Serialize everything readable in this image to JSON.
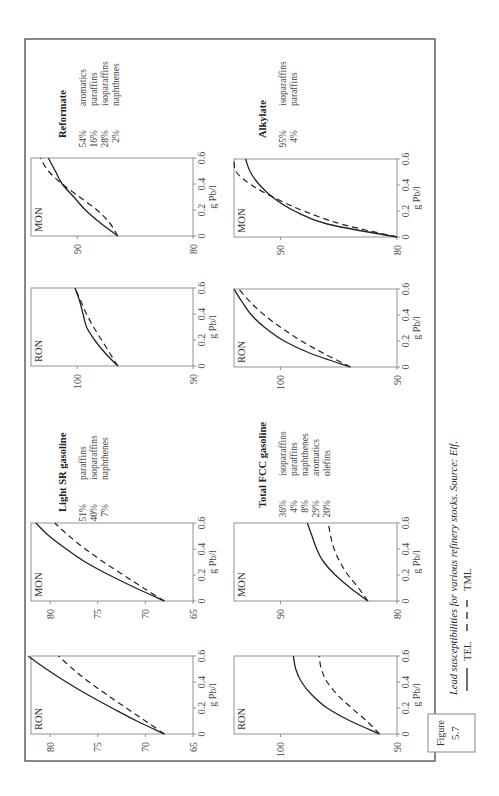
{
  "figure": {
    "label": "Figure",
    "number": "5.7",
    "caption": "Lead susceptibilities for various refinery stocks. Source: Elf.",
    "legend": [
      {
        "name": "TEL",
        "style": "solid"
      },
      {
        "name": "TML",
        "style": "dashed"
      }
    ],
    "x_axis_label": "g Pb/l",
    "x_ticks": [
      "0",
      "0.2",
      "0.4",
      "0.6"
    ]
  },
  "stocks": [
    {
      "name": "Reformate",
      "composition": [
        {
          "pct": "54%",
          "component": "aromatics"
        },
        {
          "pct": "16%",
          "component": "paraffins"
        },
        {
          "pct": "28%",
          "component": "isoparaffins"
        },
        {
          "pct": "2%",
          "component": "naphthenes"
        }
      ]
    },
    {
      "name": "Alkylate",
      "composition": [
        {
          "pct": "95%",
          "component": "isoparaffins"
        },
        {
          "pct": "4%",
          "component": "paraffins"
        }
      ]
    },
    {
      "name": "Light SR gasoline",
      "composition": [
        {
          "pct": "51%",
          "component": "paraffins"
        },
        {
          "pct": "40%",
          "component": "isoparaffins"
        },
        {
          "pct": "7%",
          "component": "naphthenes"
        }
      ]
    },
    {
      "name": "Total FCC gasoline",
      "composition": [
        {
          "pct": "36%",
          "component": "isoparaffins"
        },
        {
          "pct": "4%",
          "component": "paraffins"
        },
        {
          "pct": "8%",
          "component": "naphthenes"
        },
        {
          "pct": "29%",
          "component": "aromatics"
        },
        {
          "pct": "20%",
          "component": "olefins"
        }
      ]
    }
  ],
  "chart_data": [
    {
      "type": "line",
      "stock": "Reformate",
      "panel": "MON",
      "xlabel": "g Pb/l",
      "ylabel": "MON",
      "xlim": [
        0,
        0.6
      ],
      "ylim": [
        80,
        94
      ],
      "y_ticks": [
        "80",
        "90"
      ],
      "x": [
        0,
        0.1,
        0.2,
        0.3,
        0.4,
        0.5,
        0.6
      ],
      "series": [
        {
          "name": "TEL",
          "values": [
            86.5,
            88.0,
            89.3,
            90.3,
            91.3,
            91.9,
            92.5
          ]
        },
        {
          "name": "TML",
          "values": [
            86.5,
            87.2,
            88.3,
            89.8,
            91.3,
            92.5,
            93.2
          ]
        }
      ]
    },
    {
      "type": "line",
      "stock": "Reformate",
      "panel": "RON",
      "xlabel": "g Pb/l",
      "ylabel": "RON",
      "xlim": [
        0,
        0.6
      ],
      "ylim": [
        90,
        104
      ],
      "y_ticks": [
        "90",
        "100"
      ],
      "x": [
        0,
        0.1,
        0.2,
        0.3,
        0.4,
        0.5,
        0.6
      ],
      "series": [
        {
          "name": "TEL",
          "values": [
            96.5,
            97.6,
            98.5,
            99.2,
            99.5,
            99.8,
            100.2
          ]
        },
        {
          "name": "TML",
          "values": [
            96.5,
            97.2,
            97.9,
            98.6,
            99.2,
            99.7,
            100.2
          ]
        }
      ]
    },
    {
      "type": "line",
      "stock": "Alkylate",
      "panel": "MON",
      "xlabel": "g Pb/l",
      "ylabel": "MON",
      "xlim": [
        0,
        0.6
      ],
      "ylim": [
        80,
        94
      ],
      "y_ticks": [
        "80",
        "90"
      ],
      "x": [
        0,
        0.1,
        0.2,
        0.3,
        0.4,
        0.5,
        0.6
      ],
      "series": [
        {
          "name": "TEL",
          "values": [
            80.0,
            86.0,
            88.8,
            90.6,
            91.8,
            92.6,
            93.0
          ]
        },
        {
          "name": "TML",
          "values": [
            80.0,
            84.8,
            88.0,
            90.5,
            92.5,
            93.8,
            94.0
          ]
        }
      ]
    },
    {
      "type": "line",
      "stock": "Alkylate",
      "panel": "RON",
      "xlabel": "g Pb/l",
      "ylabel": "RON",
      "xlim": [
        0,
        0.6
      ],
      "ylim": [
        90,
        104
      ],
      "y_ticks": [
        "90",
        "100"
      ],
      "x": [
        0,
        0.1,
        0.2,
        0.3,
        0.4,
        0.5,
        0.6
      ],
      "series": [
        {
          "name": "TEL",
          "values": [
            94.0,
            97.3,
            99.7,
            101.3,
            102.5,
            103.3,
            104.0
          ]
        },
        {
          "name": "TML",
          "values": [
            94.0,
            96.2,
            98.2,
            99.9,
            101.4,
            102.6,
            103.6
          ]
        }
      ]
    },
    {
      "type": "line",
      "stock": "Light SR gasoline",
      "panel": "MON",
      "xlabel": "g Pb/l",
      "ylabel": "MON",
      "xlim": [
        0,
        0.6
      ],
      "ylim": [
        65,
        82
      ],
      "y_ticks": [
        "65",
        "70",
        "75",
        "80"
      ],
      "x": [
        0,
        0.1,
        0.2,
        0.3,
        0.4,
        0.5,
        0.6
      ],
      "series": [
        {
          "name": "TEL",
          "values": [
            68.0,
            71.0,
            73.8,
            76.3,
            78.3,
            80.1,
            81.5
          ]
        },
        {
          "name": "TML",
          "values": [
            68.0,
            70.2,
            72.3,
            74.4,
            76.3,
            78.0,
            79.5
          ]
        }
      ]
    },
    {
      "type": "line",
      "stock": "Light SR gasoline",
      "panel": "RON",
      "xlabel": "g Pb/l",
      "ylabel": "RON",
      "xlim": [
        0,
        0.6
      ],
      "ylim": [
        65,
        82
      ],
      "y_ticks": [
        "65",
        "70",
        "75",
        "80"
      ],
      "x": [
        0,
        0.1,
        0.2,
        0.3,
        0.4,
        0.5,
        0.6
      ],
      "series": [
        {
          "name": "TEL",
          "values": [
            68.0,
            70.9,
            73.5,
            76.0,
            78.3,
            80.4,
            82.3
          ]
        },
        {
          "name": "TML",
          "values": [
            68.0,
            70.0,
            72.0,
            74.0,
            75.9,
            77.6,
            79.1
          ]
        }
      ]
    },
    {
      "type": "line",
      "stock": "Total FCC gasoline",
      "panel": "MON",
      "xlabel": "g Pb/l",
      "ylabel": "MON",
      "xlim": [
        0,
        0.6
      ],
      "ylim": [
        80,
        94
      ],
      "y_ticks": [
        "80",
        "90"
      ],
      "x": [
        0,
        0.1,
        0.2,
        0.3,
        0.4,
        0.5,
        0.6
      ],
      "series": [
        {
          "name": "TEL",
          "values": [
            82.5,
            84.0,
            85.3,
            86.3,
            86.9,
            87.3,
            87.7
          ]
        },
        {
          "name": "TML",
          "values": [
            82.5,
            83.3,
            84.2,
            84.9,
            85.4,
            85.7,
            85.9
          ]
        }
      ]
    },
    {
      "type": "line",
      "stock": "Total FCC gasoline",
      "panel": "RON",
      "xlabel": "g Pb/l",
      "ylabel": "RON",
      "xlim": [
        0,
        0.6
      ],
      "ylim": [
        90,
        104
      ],
      "y_ticks": [
        "90",
        "100"
      ],
      "x": [
        0,
        0.1,
        0.2,
        0.3,
        0.4,
        0.5,
        0.6
      ],
      "series": [
        {
          "name": "TEL",
          "values": [
            91.5,
            94.0,
            96.0,
            97.3,
            98.2,
            98.7,
            98.9
          ]
        },
        {
          "name": "TML",
          "values": [
            91.5,
            92.6,
            93.9,
            95.1,
            96.0,
            96.5,
            96.7
          ]
        }
      ]
    }
  ]
}
